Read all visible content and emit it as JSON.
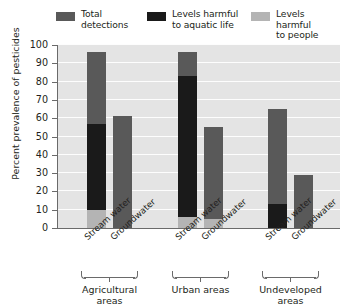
{
  "chart_data": {
    "type": "bar",
    "subtype": "stacked-overlay-grouped",
    "title": "",
    "xlabel": "",
    "ylabel": "Percent prevalence of pesticides",
    "ylim": [
      0,
      100
    ],
    "yticks": [
      0,
      10,
      20,
      30,
      40,
      50,
      60,
      70,
      80,
      90,
      100
    ],
    "ytick_labels": [
      "0",
      "10",
      "20",
      "30",
      "40",
      "50",
      "60",
      "70",
      "80",
      "90",
      "100"
    ],
    "grid": true,
    "legend_position": "top",
    "categories": [
      "Agricultural areas - Stream water",
      "Agricultural areas - Groundwater",
      "Urban areas - Stream water",
      "Urban areas - Groundwater",
      "Undeveloped areas - Stream water",
      "Undeveloped areas - Groundwater"
    ],
    "groups": [
      {
        "label": "Agricultural areas",
        "sites": [
          {
            "label": "Stream water",
            "total": 96,
            "aquatic": 57,
            "people": 10
          },
          {
            "label": "Groundwater",
            "total": 61,
            "aquatic": 0,
            "people": 0
          }
        ]
      },
      {
        "label": "Urban areas",
        "sites": [
          {
            "label": "Stream water",
            "total": 96,
            "aquatic": 83,
            "people": 6
          },
          {
            "label": "Groundwater",
            "total": 55,
            "aquatic": 0,
            "people": 5
          }
        ]
      },
      {
        "label": "Undeveloped\nareas",
        "sites": [
          {
            "label": "Stream water",
            "total": 65,
            "aquatic": 13,
            "people": 0
          },
          {
            "label": "Groundwater",
            "total": 29,
            "aquatic": 0,
            "people": 0
          }
        ]
      }
    ],
    "series": [
      {
        "name": "Total detections",
        "values": [
          96,
          61,
          96,
          55,
          65,
          29
        ],
        "color": "#595959"
      },
      {
        "name": "Levels harmful to aquatic life",
        "values": [
          57,
          0,
          83,
          0,
          13,
          0
        ],
        "color": "#1a1a1a"
      },
      {
        "name": "Levels harmful to people",
        "values": [
          10,
          0,
          6,
          5,
          0,
          0
        ],
        "color": "#b4b4b4"
      }
    ]
  },
  "legend": {
    "items": [
      {
        "label": "Total\ndetections",
        "color": "#595959"
      },
      {
        "label": "Levels harmful\nto aquatic life",
        "color": "#1a1a1a"
      },
      {
        "label": "Levels harmful\nto people",
        "color": "#b4b4b4"
      }
    ]
  },
  "colors": {
    "plot_background": "#e4e4e4",
    "gridline": "#fdfdfd",
    "axis": "#6a6a6a",
    "text": "#231f20",
    "total_detections": "#595959",
    "harmful_aquatic": "#1a1a1a",
    "harmful_people": "#b4b4b4"
  }
}
